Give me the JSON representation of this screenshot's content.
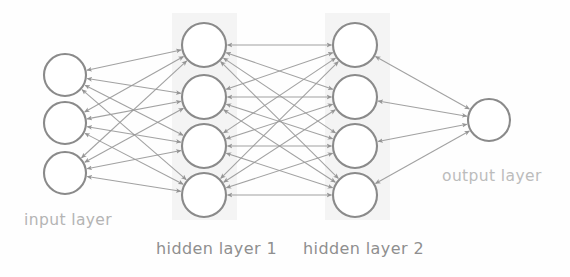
{
  "diagram": {
    "type": "neural-network-architecture",
    "title": "",
    "background_color": "#fefefe",
    "node_stroke_color": "#8a8a8a",
    "node_fill_color": "#ffffff",
    "edge_color": "#9a9a9a",
    "band_color": "#f2f2f2",
    "labels": {
      "input": "input layer",
      "hidden1": "hidden layer 1",
      "hidden2": "hidden layer 2",
      "output": "output layer"
    },
    "label_colors": {
      "input": "#b4b4b4",
      "hidden1": "#8f8f8f",
      "hidden2": "#8f8f8f",
      "output": "#bcbcbc"
    },
    "edge_style": "bidirectional-arrows",
    "connectivity": "fully-connected",
    "layers": [
      {
        "name": "input layer",
        "id": "input",
        "node_count": 3,
        "cx": 65,
        "radius": 21,
        "nodes_y": [
          75,
          123,
          173
        ],
        "has_band": false
      },
      {
        "name": "hidden layer 1",
        "id": "hidden1",
        "node_count": 4,
        "cx": 204,
        "radius": 22,
        "nodes_y": [
          45,
          97,
          146,
          195
        ],
        "has_band": true,
        "band_x": 172,
        "band_width": 65,
        "band_y": 13,
        "band_height": 207
      },
      {
        "name": "hidden layer 2",
        "id": "hidden2",
        "node_count": 4,
        "cx": 355,
        "radius": 22,
        "nodes_y": [
          45,
          97,
          146,
          195
        ],
        "has_band": true,
        "band_x": 325,
        "band_width": 65,
        "band_y": 13,
        "band_height": 207
      },
      {
        "name": "output layer",
        "id": "output",
        "node_count": 1,
        "cx": 489,
        "radius": 21,
        "nodes_y": [
          120
        ],
        "has_band": false
      }
    ]
  }
}
